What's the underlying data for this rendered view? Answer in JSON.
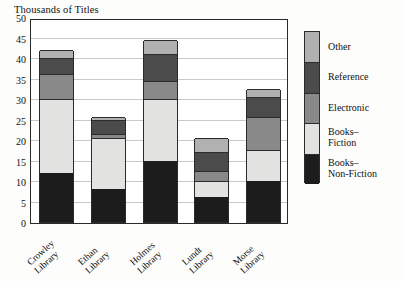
{
  "chart_data": {
    "type": "bar",
    "subtype": "stacked-bar",
    "title": "Thousands of Titles",
    "xlabel": "",
    "ylabel": "Thousands of Titles",
    "ylim": [
      0,
      50
    ],
    "yticks": [
      0,
      5,
      10,
      15,
      20,
      25,
      30,
      35,
      40,
      45,
      50
    ],
    "ytick_labels": [
      "0",
      "5",
      "10",
      "15",
      "20",
      "25",
      "30",
      "35",
      "40",
      "45",
      "50"
    ],
    "grid": true,
    "legend_position": "right",
    "categories": [
      "Crowley Library",
      "Ethan Library",
      "Holmes Library",
      "Lundt Library",
      "Morse Library"
    ],
    "category_lines": [
      [
        "Crowley",
        "Library"
      ],
      [
        "Ethan",
        "Library"
      ],
      [
        "Holmes",
        "Library"
      ],
      [
        "Lundt",
        "Library"
      ],
      [
        "Morse",
        "Library"
      ]
    ],
    "series": [
      {
        "name": "Books–Non-Fiction",
        "name_lines": [
          "Books–",
          "Non-Fiction"
        ],
        "color": "#1c1c1c",
        "values": [
          12,
          8,
          15,
          6,
          10
        ]
      },
      {
        "name": "Books–Fiction",
        "name_lines": [
          "Books–",
          "Fiction"
        ],
        "color": "#e2e2e0",
        "values": [
          18,
          12.5,
          15,
          4,
          7.5
        ]
      },
      {
        "name": "Electronic",
        "name_lines": [
          "Electronic"
        ],
        "color": "#898989",
        "values": [
          6,
          1,
          4.5,
          2.5,
          8
        ]
      },
      {
        "name": "Reference",
        "name_lines": [
          "Reference"
        ],
        "color": "#4b4b4b",
        "values": [
          4,
          3.5,
          6.5,
          4.5,
          5
        ]
      },
      {
        "name": "Other",
        "name_lines": [
          "Other"
        ],
        "color": "#b1b1b1",
        "values": [
          2,
          0.7,
          3.5,
          3.5,
          2
        ]
      }
    ],
    "totals": [
      42,
      25.7,
      44.5,
      20.5,
      32.5
    ],
    "legend_entries": [
      {
        "label": "Other",
        "label_lines": [
          "Other"
        ],
        "color": "#b1b1b1"
      },
      {
        "label": "Reference",
        "label_lines": [
          "Reference"
        ],
        "color": "#4b4b4b"
      },
      {
        "label": "Electronic",
        "label_lines": [
          "Electronic"
        ],
        "color": "#898989"
      },
      {
        "label": "Books–Fiction",
        "label_lines": [
          "Books–",
          "Fiction"
        ],
        "color": "#e2e2e0"
      },
      {
        "label": "Books–Non-Fiction",
        "label_lines": [
          "Books–",
          "Non-Fiction"
        ],
        "color": "#1c1c1c"
      }
    ]
  }
}
